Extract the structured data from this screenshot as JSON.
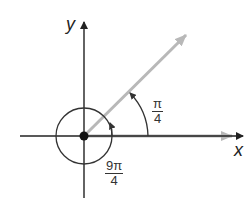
{
  "diagram": {
    "axes": {
      "x_label": "x",
      "y_label": "y"
    },
    "angles": [
      {
        "name": "reference-angle",
        "label_num": "π",
        "label_den": "4",
        "value": "π/4"
      },
      {
        "name": "coterminal-angle",
        "label_num": "9π",
        "label_den": "4",
        "value": "9π/4"
      }
    ],
    "colors": {
      "axes": "#222222",
      "ray": "#b8b8b8",
      "arc": "#333333"
    }
  }
}
